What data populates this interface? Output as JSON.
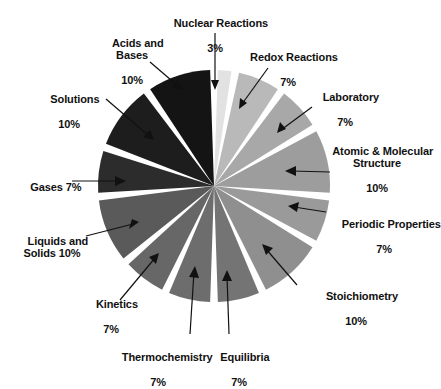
{
  "chart_data": {
    "type": "pie",
    "title": "",
    "legend_position": "none",
    "grid": false,
    "units": "percent",
    "total_label": "100%",
    "start_angle_deg": 0,
    "direction": "clockwise",
    "categories": [
      "Nuclear Reactions",
      "Redox Reactions",
      "Laboratory",
      "Atomic & Molecular Structure",
      "Periodic Properties",
      "Stoichiometry",
      "Equilibria",
      "Thermochemistry",
      "Kinetics",
      "Liquids and Solids",
      "Gases",
      "Solutions",
      "Acids and Bases"
    ],
    "values": [
      3,
      7,
      7,
      10,
      7,
      10,
      7,
      7,
      7,
      10,
      7,
      10,
      10
    ],
    "value_labels": [
      "3%",
      "7%",
      "7%",
      "10%",
      "7%",
      "10%",
      "7%",
      "7%",
      "7%",
      "10%",
      "7%",
      "10%",
      "10%"
    ],
    "slice_colors": [
      "#e2e2e2",
      "#b9b9b9",
      "#a8a8a8",
      "#9d9d9d",
      "#9a9a9a",
      "#8f8f8f",
      "#747474",
      "#6d6d6d",
      "#676767",
      "#5a5a5a",
      "#2c2c2c",
      "#1d1d1d",
      "#141414"
    ],
    "separator_color": "#ffffff",
    "background_color": "#ffffff"
  },
  "labels": {
    "nuclear": {
      "name": "Nuclear Reactions",
      "pct": "3%"
    },
    "redox": {
      "name": "Redox Reactions",
      "pct": "7%"
    },
    "laboratory": {
      "name": "Laboratory",
      "pct": "7%"
    },
    "atomic": {
      "name": "Atomic & Molecular\nStructure",
      "pct": "10%"
    },
    "periodic": {
      "name": "Periodic Properties",
      "pct": "7%"
    },
    "stoich": {
      "name": "Stoichiometry",
      "pct": "10%"
    },
    "equilibria": {
      "name": "Equilibria",
      "pct": "7%"
    },
    "thermo": {
      "name": "Thermochemistry",
      "pct": "7%"
    },
    "kinetics": {
      "name": "Kinetics",
      "pct": "7%"
    },
    "liquids": {
      "name": "Liquids and\nSolids 10%",
      "pct": ""
    },
    "gases": {
      "name": "Gases 7%",
      "pct": ""
    },
    "solutions": {
      "name": "Solutions",
      "pct": "10%"
    },
    "acids": {
      "name": "Acids and\nBases",
      "pct": "10%"
    }
  },
  "geometry": {
    "center_x": 214,
    "center_y": 186,
    "radius": 116
  }
}
